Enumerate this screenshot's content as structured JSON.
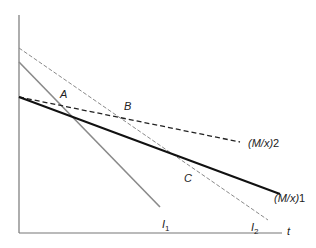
{
  "diagram": {
    "axes": {
      "x_label": "t",
      "y_label": ""
    },
    "points": [
      {
        "name": "A",
        "label": "A"
      },
      {
        "name": "B",
        "label": "B"
      },
      {
        "name": "C",
        "label": "C"
      }
    ],
    "lines": [
      {
        "id": "mx1",
        "label_main": "(M/x)",
        "label_num": "1",
        "style": "solid-thick",
        "color": "#111111"
      },
      {
        "id": "mx2",
        "label_main": "(M/x)",
        "label_num": "2",
        "style": "dashed",
        "color": "#222222"
      },
      {
        "id": "i1",
        "label_main": "I",
        "label_sub": "1",
        "style": "solid",
        "color": "#8a8a8a"
      },
      {
        "id": "i2",
        "label_main": "I",
        "label_sub": "2",
        "style": "dashed-thin",
        "color": "#8a8a8a"
      }
    ]
  }
}
